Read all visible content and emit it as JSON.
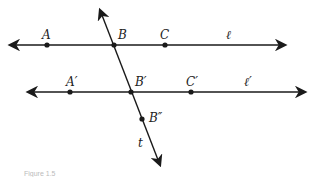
{
  "figure": {
    "caption": "Figure 1.5",
    "line_color": "#1a1a1a",
    "lines": [
      {
        "name": "ℓ",
        "y": 45,
        "x1": 10,
        "x2": 285
      },
      {
        "name": "ℓ′",
        "y": 92,
        "x1": 28,
        "x2": 305
      }
    ],
    "transversal": {
      "name": "t",
      "x1": 100,
      "y1": 10,
      "x2": 160,
      "y2": 165
    },
    "points": [
      {
        "label": "A",
        "x": 47,
        "y": 45
      },
      {
        "label": "B",
        "x": 114,
        "y": 45
      },
      {
        "label": "C",
        "x": 165,
        "y": 45
      },
      {
        "label": "A′",
        "x": 70,
        "y": 92
      },
      {
        "label": "B′",
        "x": 131,
        "y": 92
      },
      {
        "label": "C′",
        "x": 191,
        "y": 92
      },
      {
        "label": "B″",
        "x": 142,
        "y": 119
      }
    ],
    "labels": {
      "A": "A",
      "B": "B",
      "C": "C",
      "l": "ℓ",
      "A_prime": "A′",
      "B_prime": "B′",
      "C_prime": "C′",
      "l_prime": "ℓ′",
      "B_double_prime": "B″",
      "t": "t"
    }
  }
}
